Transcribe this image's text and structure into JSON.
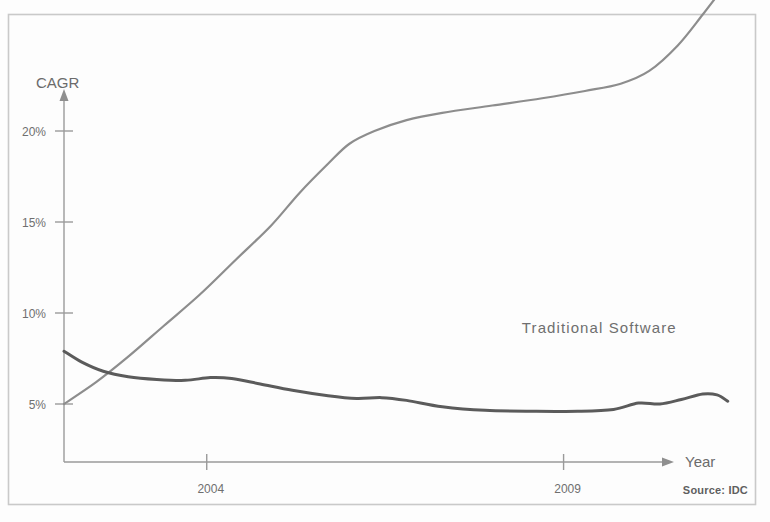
{
  "figure": {
    "background_color": "#fdfdfd",
    "frame_color": "#c9c9c9",
    "axis_color": "#9a9a9a"
  },
  "chart_data": {
    "type": "line",
    "title": "",
    "subtitle": "",
    "xlabel": "Year",
    "ylabel": "CAGR",
    "grid": false,
    "legend_position": "inline-labels",
    "xlim": [
      2002,
      2011.5
    ],
    "ylim": [
      3.2,
      29
    ],
    "x_ticks": [
      {
        "value": 2004,
        "label": "2004"
      },
      {
        "value": 2009,
        "label": "2009"
      }
    ],
    "y_ticks": [
      {
        "value": 5,
        "label": "5%"
      },
      {
        "value": 10,
        "label": "10%"
      },
      {
        "value": 15,
        "label": "15%"
      },
      {
        "value": 20,
        "label": "20%"
      }
    ],
    "series": [
      {
        "name": "Software-as-a-Service",
        "label": "Software-as-a-Service",
        "color": "#8d8d8d",
        "stroke_width": 2.2,
        "label_x": 2009.05,
        "label_y": 29.6,
        "label_anchor": "middle",
        "points": [
          {
            "x": 2002.0,
            "y": 5.0
          },
          {
            "x": 2002.45,
            "y": 6.2
          },
          {
            "x": 2002.9,
            "y": 7.6
          },
          {
            "x": 2003.4,
            "y": 9.3
          },
          {
            "x": 2003.9,
            "y": 11.0
          },
          {
            "x": 2004.4,
            "y": 12.9
          },
          {
            "x": 2004.9,
            "y": 14.8
          },
          {
            "x": 2005.3,
            "y": 16.6
          },
          {
            "x": 2005.7,
            "y": 18.2
          },
          {
            "x": 2006.0,
            "y": 19.3
          },
          {
            "x": 2006.35,
            "y": 20.0
          },
          {
            "x": 2006.8,
            "y": 20.6
          },
          {
            "x": 2007.3,
            "y": 21.0
          },
          {
            "x": 2008.0,
            "y": 21.4
          },
          {
            "x": 2008.7,
            "y": 21.8
          },
          {
            "x": 2009.3,
            "y": 22.2
          },
          {
            "x": 2009.8,
            "y": 22.6
          },
          {
            "x": 2010.2,
            "y": 23.3
          },
          {
            "x": 2010.6,
            "y": 24.7
          },
          {
            "x": 2010.95,
            "y": 26.4
          },
          {
            "x": 2011.3,
            "y": 28.2
          },
          {
            "x": 2011.45,
            "y": 29.0
          }
        ]
      },
      {
        "name": "Traditional Software",
        "label": "Traditional Software",
        "color": "#5b5b5b",
        "stroke_width": 3.0,
        "label_x": 2009.5,
        "label_y": 8.9,
        "label_anchor": "middle",
        "points": [
          {
            "x": 2002.0,
            "y": 7.9
          },
          {
            "x": 2002.25,
            "y": 7.3
          },
          {
            "x": 2002.55,
            "y": 6.8
          },
          {
            "x": 2002.9,
            "y": 6.5
          },
          {
            "x": 2003.3,
            "y": 6.35
          },
          {
            "x": 2003.7,
            "y": 6.3
          },
          {
            "x": 2004.05,
            "y": 6.45
          },
          {
            "x": 2004.35,
            "y": 6.4
          },
          {
            "x": 2004.75,
            "y": 6.1
          },
          {
            "x": 2005.2,
            "y": 5.75
          },
          {
            "x": 2005.7,
            "y": 5.45
          },
          {
            "x": 2006.1,
            "y": 5.3
          },
          {
            "x": 2006.45,
            "y": 5.35
          },
          {
            "x": 2006.8,
            "y": 5.2
          },
          {
            "x": 2007.3,
            "y": 4.85
          },
          {
            "x": 2007.9,
            "y": 4.65
          },
          {
            "x": 2008.6,
            "y": 4.6
          },
          {
            "x": 2009.2,
            "y": 4.6
          },
          {
            "x": 2009.7,
            "y": 4.7
          },
          {
            "x": 2010.05,
            "y": 5.05
          },
          {
            "x": 2010.35,
            "y": 5.0
          },
          {
            "x": 2010.65,
            "y": 5.25
          },
          {
            "x": 2010.95,
            "y": 5.55
          },
          {
            "x": 2011.15,
            "y": 5.5
          },
          {
            "x": 2011.3,
            "y": 5.15
          }
        ]
      }
    ],
    "annotations": [
      {
        "name": "source-note",
        "text": "Source: IDC"
      }
    ]
  },
  "source": {
    "text": "Source: IDC"
  }
}
